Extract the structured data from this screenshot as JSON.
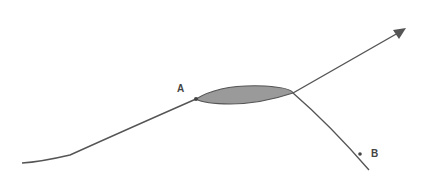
{
  "diagram": {
    "type": "path-diagram",
    "points": [
      {
        "id": "A",
        "label": "A",
        "x": 196,
        "y": 99
      },
      {
        "id": "B",
        "label": "B",
        "x": 361,
        "y": 154
      }
    ],
    "shapes": [
      {
        "kind": "lens",
        "description": "shaded elongated lens region between the path from A and the junction",
        "fill": "#9a9a9a",
        "stroke": "#555555"
      }
    ],
    "curves": [
      {
        "id": "incoming",
        "description": "curve from lower-left rising to point A"
      },
      {
        "id": "outgoing-arrow",
        "description": "line from junction rising to upper-right ending in arrowhead"
      },
      {
        "id": "branch-to-B",
        "description": "line from junction descending to lower-right past point B"
      }
    ],
    "colors": {
      "line": "#555555",
      "fill": "#9a9a9a",
      "label": "#444444"
    }
  }
}
